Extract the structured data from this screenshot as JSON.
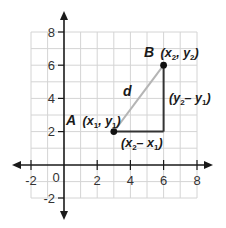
{
  "diagram": {
    "colors": {
      "grid": "#d4d4d4",
      "axis": "#1a1a1a",
      "hypotenuse": "#b5b5b5",
      "legs": "#333333",
      "points": "#111111"
    },
    "x_axis": {
      "tick_labels": [
        "-2",
        "2",
        "4",
        "6",
        "8"
      ],
      "origin_label": "0",
      "range": [
        -2,
        8
      ]
    },
    "y_axis": {
      "tick_labels": [
        "8",
        "6",
        "4",
        "2",
        "-2"
      ],
      "range": [
        -2,
        8
      ]
    },
    "points": {
      "A": {
        "name": "A",
        "coords_text": "(x",
        "sub1": "1",
        "mid": ", y",
        "sub2": "1",
        "close": ")",
        "x": 3,
        "y": 2
      },
      "B": {
        "name": "B",
        "coords_text": "(x",
        "sub1": "2",
        "mid": ", y",
        "sub2": "2",
        "close": ")",
        "x": 6,
        "y": 6
      }
    },
    "labels": {
      "distance": "d",
      "horizontal_leg": {
        "open": "(x",
        "sub1": "2",
        "mid": "– x",
        "sub2": "1",
        "close": ")"
      },
      "vertical_leg": {
        "open": "(y",
        "sub1": "2",
        "mid": "– y",
        "sub2": "1",
        "close": ")"
      }
    }
  }
}
